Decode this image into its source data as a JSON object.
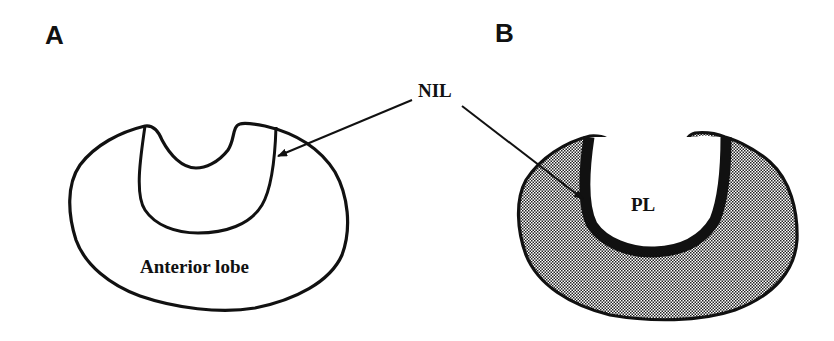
{
  "panels": [
    {
      "label": "A",
      "region_label": "Anterior lobe"
    },
    {
      "label": "B",
      "region_label": "PL"
    }
  ],
  "shared_annotation": {
    "label": "NIL"
  },
  "colors": {
    "outline": "#111111",
    "shading": "#9a9a9a",
    "background": "#ffffff"
  }
}
